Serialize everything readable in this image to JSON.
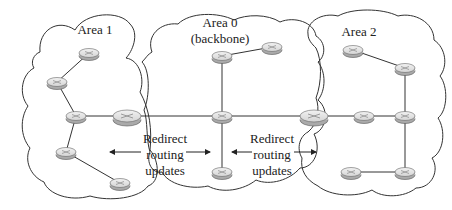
{
  "areas": [
    {
      "id": "area1",
      "label": "Area 1"
    },
    {
      "id": "area0",
      "label": "Area 0",
      "sublabel": "(backbone)"
    },
    {
      "id": "area2",
      "label": "Area 2"
    }
  ],
  "annotations": {
    "left": [
      "Redirect",
      "routing",
      "updates"
    ],
    "right": [
      "Redirect",
      "routing",
      "updates"
    ]
  },
  "routers": [
    {
      "id": "a1r1",
      "area": "area1",
      "x": 89,
      "y": 53,
      "type": "internal"
    },
    {
      "id": "a1r2",
      "area": "area1",
      "x": 57,
      "y": 82,
      "type": "internal"
    },
    {
      "id": "a1r3",
      "area": "area1",
      "x": 76,
      "y": 116,
      "type": "internal"
    },
    {
      "id": "a1r4",
      "area": "area1",
      "x": 66,
      "y": 152,
      "type": "internal"
    },
    {
      "id": "a1r5",
      "area": "area1",
      "x": 120,
      "y": 183,
      "type": "internal"
    },
    {
      "id": "abr1",
      "area": "area1/area0",
      "x": 127,
      "y": 116,
      "type": "area-border"
    },
    {
      "id": "a0r1",
      "area": "area0",
      "x": 222,
      "y": 56,
      "type": "internal"
    },
    {
      "id": "a0r2",
      "area": "area0",
      "x": 272,
      "y": 47,
      "type": "internal"
    },
    {
      "id": "a0r3",
      "area": "area0",
      "x": 222,
      "y": 116,
      "type": "internal"
    },
    {
      "id": "a0r4",
      "area": "area0",
      "x": 222,
      "y": 172,
      "type": "internal"
    },
    {
      "id": "abr2",
      "area": "area0/area2",
      "x": 314,
      "y": 116,
      "type": "area-border"
    },
    {
      "id": "a2r1",
      "area": "area2",
      "x": 353,
      "y": 50,
      "type": "internal"
    },
    {
      "id": "a2r2",
      "area": "area2",
      "x": 405,
      "y": 68,
      "type": "internal"
    },
    {
      "id": "a2r3",
      "area": "area2",
      "x": 364,
      "y": 116,
      "type": "internal"
    },
    {
      "id": "a2r4",
      "area": "area2",
      "x": 405,
      "y": 116,
      "type": "internal"
    },
    {
      "id": "a2r5",
      "area": "area2",
      "x": 351,
      "y": 172,
      "type": "internal"
    },
    {
      "id": "a2r6",
      "area": "area2",
      "x": 405,
      "y": 172,
      "type": "internal"
    }
  ],
  "links": [
    [
      "a1r1",
      "a1r2"
    ],
    [
      "a1r2",
      "a1r3"
    ],
    [
      "a1r3",
      "abr1"
    ],
    [
      "a1r3",
      "a1r4"
    ],
    [
      "a1r4",
      "a1r5"
    ],
    [
      "abr1",
      "a0r3"
    ],
    [
      "a0r1",
      "a0r2"
    ],
    [
      "a0r1",
      "a0r3"
    ],
    [
      "a0r3",
      "a0r4"
    ],
    [
      "a0r3",
      "abr2"
    ],
    [
      "abr2",
      "a2r3"
    ],
    [
      "a2r3",
      "a2r4"
    ],
    [
      "a2r1",
      "a2r2"
    ],
    [
      "a2r2",
      "a2r4"
    ],
    [
      "a2r4",
      "a2r6"
    ],
    [
      "a2r6",
      "a2r5"
    ]
  ],
  "colors": {
    "line": "#333333",
    "router_top": "#e6e6e6",
    "router_side": "#b8b8b8",
    "background": "#ffffff"
  }
}
